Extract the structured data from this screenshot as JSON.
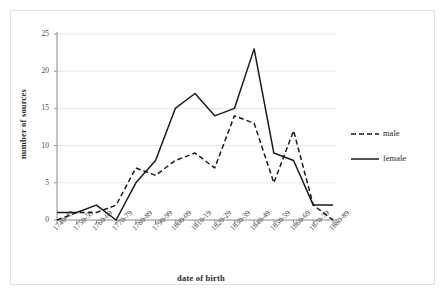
{
  "chart_data": {
    "type": "line",
    "title": "",
    "xlabel": "date of birth",
    "ylabel": "number of sources",
    "ylim": [
      0,
      25
    ],
    "yticks": [
      0,
      5,
      10,
      15,
      20,
      25
    ],
    "grid": true,
    "legend_position": "right",
    "categories": [
      "1740-49",
      "1750-59",
      "1760-69",
      "1770-79",
      "1780-89",
      "1790-99",
      "1800-09",
      "1810-19",
      "1820-29",
      "1830-39",
      "1840-49",
      "1850-59",
      "1860-69",
      "1870-79",
      "1880-89"
    ],
    "series": [
      {
        "name": "male",
        "style": "dashed",
        "color": "#1a1a1a",
        "values": [
          0,
          1,
          1,
          2,
          7,
          6,
          8,
          9,
          7,
          14,
          13,
          5,
          12,
          2,
          0
        ]
      },
      {
        "name": "female",
        "style": "solid",
        "color": "#1a1a1a",
        "values": [
          1,
          1,
          2,
          0,
          5,
          8,
          15,
          17,
          14,
          15,
          23,
          9,
          8,
          2,
          2
        ]
      }
    ]
  },
  "legend": {
    "items": [
      {
        "label": "male"
      },
      {
        "label": "female"
      }
    ]
  },
  "colors": {
    "line": "#1a1a1a",
    "grid": "#e8e8e8",
    "axis": "#8c8c8c",
    "frame": "#e2e2e2"
  }
}
